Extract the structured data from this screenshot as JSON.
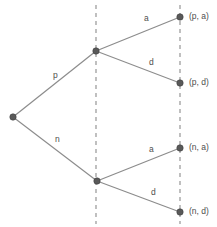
{
  "figure": {
    "type": "extensive-form-game-tree",
    "caption_clipped": "",
    "colors": {
      "edge": "#8c8c8c",
      "node": "#595959",
      "information_set": "#8c8c8c",
      "text": "#4d4d4d",
      "background": "#ffffff"
    }
  },
  "nodes": [
    {
      "id": "root",
      "name": "root-node",
      "x": 13,
      "y": 117
    },
    {
      "id": "upper",
      "name": "upper-decision-node",
      "x": 96,
      "y": 51
    },
    {
      "id": "lower",
      "name": "lower-decision-node",
      "x": 97,
      "y": 181
    },
    {
      "id": "t1",
      "name": "terminal-node-pa",
      "x": 180,
      "y": 17
    },
    {
      "id": "t2",
      "name": "terminal-node-pd",
      "x": 180,
      "y": 83
    },
    {
      "id": "t3",
      "name": "terminal-node-na",
      "x": 180,
      "y": 148
    },
    {
      "id": "t4",
      "name": "terminal-node-nd",
      "x": 180,
      "y": 212
    }
  ],
  "edges": [
    {
      "id": "e-p",
      "from": "root",
      "to": "upper",
      "label": "p",
      "label_x": 53,
      "label_y": 70
    },
    {
      "id": "e-n",
      "from": "root",
      "to": "lower",
      "label": "n",
      "label_x": 55,
      "label_y": 134
    },
    {
      "id": "e-ua",
      "from": "upper",
      "to": "t1",
      "label": "a",
      "label_x": 144,
      "label_y": 13
    },
    {
      "id": "e-ud",
      "from": "upper",
      "to": "t2",
      "label": "d",
      "label_x": 149,
      "label_y": 57
    },
    {
      "id": "e-la",
      "from": "lower",
      "to": "t3",
      "label": "a",
      "label_x": 149,
      "label_y": 144
    },
    {
      "id": "e-ld",
      "from": "lower",
      "to": "t4",
      "label": "d",
      "label_x": 151,
      "label_y": 187
    }
  ],
  "information_sets": [
    {
      "id": "info-left",
      "name": "information-set-line-left",
      "x": 96,
      "y1": 5,
      "y2": 224
    },
    {
      "id": "info-right",
      "name": "information-set-line-right",
      "x": 180,
      "y1": 5,
      "y2": 224
    }
  ],
  "outcomes": [
    {
      "id": "o1",
      "label": "(p, a)",
      "x": 189,
      "y": 11
    },
    {
      "id": "o2",
      "label": "(p, d)",
      "x": 189,
      "y": 77
    },
    {
      "id": "o3",
      "label": "(n, a)",
      "x": 189,
      "y": 142
    },
    {
      "id": "o4",
      "label": "(n, d)",
      "x": 189,
      "y": 206
    }
  ]
}
